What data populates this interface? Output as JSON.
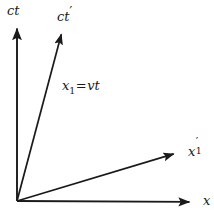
{
  "figure": {
    "kind": "minkowski-spacetime-diagram",
    "width": 214,
    "height": 211,
    "background_color": "#ffffff",
    "line_color": "#1a1a1a",
    "line_width": 1.8
  },
  "origin": {
    "x": 17,
    "y": 201
  },
  "axes": [
    {
      "id": "ct",
      "label": "ct",
      "label_parts": {
        "base": "ct",
        "prime": "",
        "subscript": ""
      },
      "from": {
        "x": 17,
        "y": 201
      },
      "to": {
        "x": 17,
        "y": 22
      },
      "arrowhead": true,
      "description": "rest-frame time axis"
    },
    {
      "id": "ct-prime",
      "label": "ct′",
      "label_parts": {
        "base": "ct",
        "prime": "′",
        "subscript": ""
      },
      "from": {
        "x": 17,
        "y": 201
      },
      "to": {
        "x": 63,
        "y": 28
      },
      "arrowhead": true,
      "description": "moving-frame time axis"
    },
    {
      "id": "x-prime-1",
      "label": "x′1",
      "label_parts": {
        "base": "x",
        "prime": "′",
        "subscript": "1"
      },
      "from": {
        "x": 17,
        "y": 201
      },
      "to": {
        "x": 180,
        "y": 152
      },
      "arrowhead": true,
      "description": "moving-frame space axis"
    },
    {
      "id": "x",
      "label": "x",
      "label_parts": {
        "base": "x",
        "prime": "",
        "subscript": ""
      },
      "from": {
        "x": 17,
        "y": 201
      },
      "to": {
        "x": 196,
        "y": 202
      },
      "arrowhead": true,
      "description": "rest-frame space axis"
    }
  ],
  "annotations": [
    {
      "id": "worldline-equation",
      "text": "x₁=vt",
      "parts": {
        "lhs_base": "x",
        "lhs_sub": "1",
        "operator": "=",
        "rhs": "vt"
      },
      "x": 62,
      "y": 79,
      "description": "equation of the ct-prime worldline"
    }
  ]
}
